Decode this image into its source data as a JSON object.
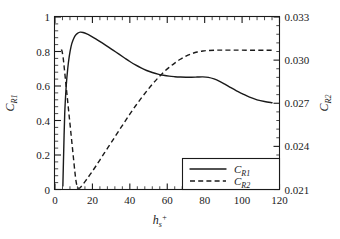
{
  "chart_data": {
    "type": "line",
    "title": "",
    "xlabel": "h_s^+",
    "xlabel_base": "h",
    "xlabel_sub": "s",
    "xlabel_sup": "+",
    "ylabel_left": "C_R1",
    "ylabel_left_base": "C",
    "ylabel_left_sub": "R1",
    "ylabel_right": "C_R2",
    "ylabel_right_base": "C",
    "ylabel_right_sub": "R2",
    "xlim": [
      0,
      120
    ],
    "ylim_left": [
      0,
      1
    ],
    "ylim_right": [
      0.021,
      0.033
    ],
    "xticks": [
      0,
      20,
      40,
      60,
      80,
      100,
      120
    ],
    "xtick_labels": [
      "0",
      "20",
      "40",
      "60",
      "80",
      "100",
      "120"
    ],
    "yticks_left": [
      0,
      0.2,
      0.4,
      0.6,
      0.8,
      1
    ],
    "ytick_labels_left": [
      "0",
      "0.2",
      "0.4",
      "0.6",
      "0.8",
      "1"
    ],
    "yticks_right": [
      0.021,
      0.024,
      0.027,
      0.03,
      0.033
    ],
    "ytick_labels_right": [
      "0.021",
      "0.024",
      "0.027",
      "0.030",
      "0.033"
    ],
    "grid": false,
    "minor_ticks_x": 4,
    "minor_ticks_y": 4,
    "legend_position": "bottom-right",
    "series": [
      {
        "name": "C_R1",
        "axis": "left",
        "style": "solid",
        "color": "#1a1a1a",
        "x": [
          4.2,
          4.6,
          5.2,
          6.0,
          6.8,
          7.6,
          8.6,
          9.6,
          10.8,
          12.0,
          13.5,
          15.0,
          17.0,
          19.0,
          22.0,
          25.0,
          28.0,
          31.0,
          34.0,
          37.0,
          40.0,
          43.0,
          46.0,
          49.0,
          52.0,
          55.0,
          58.0,
          61.0,
          64.0,
          67.0,
          70.0,
          73.0,
          76.0,
          79.0,
          82.0,
          85.0,
          88.0,
          91.0,
          94.0,
          97.0,
          100.0,
          104.0,
          108.0,
          112.0,
          116.0
        ],
        "y": [
          0.02,
          0.2,
          0.44,
          0.6,
          0.7,
          0.77,
          0.83,
          0.865,
          0.892,
          0.905,
          0.912,
          0.91,
          0.902,
          0.891,
          0.872,
          0.851,
          0.83,
          0.808,
          0.786,
          0.764,
          0.742,
          0.722,
          0.705,
          0.69,
          0.678,
          0.669,
          0.662,
          0.657,
          0.654,
          0.652,
          0.651,
          0.651,
          0.652,
          0.653,
          0.65,
          0.641,
          0.627,
          0.609,
          0.59,
          0.572,
          0.556,
          0.535,
          0.52,
          0.51,
          0.503
        ]
      },
      {
        "name": "C_R2",
        "axis": "right",
        "style": "dashed",
        "color": "#1a1a1a",
        "x": [
          3.4,
          3.8,
          4.4,
          5.0,
          5.8,
          6.6,
          7.4,
          8.2,
          9.0,
          9.8,
          10.6,
          11.2,
          11.8,
          12.6,
          13.6,
          15.0,
          17.0,
          19.5,
          22.0,
          25.0,
          28.0,
          31.0,
          34.0,
          37.0,
          40.0,
          43.0,
          46.0,
          49.0,
          52.0,
          55.0,
          58.0,
          61.0,
          64.0,
          67.0,
          70.0,
          73.0,
          76.0,
          79.0,
          82.0,
          86.0,
          90.0,
          95.0,
          100.0,
          106.0,
          112.0,
          116.0
        ],
        "y": [
          0.812,
          0.8,
          0.76,
          0.7,
          0.615,
          0.53,
          0.445,
          0.36,
          0.275,
          0.19,
          0.105,
          0.052,
          0.02,
          0.008,
          0.012,
          0.03,
          0.06,
          0.098,
          0.138,
          0.188,
          0.238,
          0.288,
          0.338,
          0.388,
          0.437,
          0.484,
          0.528,
          0.57,
          0.61,
          0.646,
          0.679,
          0.708,
          0.733,
          0.755,
          0.773,
          0.787,
          0.797,
          0.803,
          0.806,
          0.808,
          0.808,
          0.808,
          0.808,
          0.807,
          0.807,
          0.807
        ]
      }
    ]
  },
  "legend": {
    "entries": [
      {
        "label_base": "C",
        "label_sub": "R1",
        "style": "solid"
      },
      {
        "label_base": "C",
        "label_sub": "R2",
        "style": "dashed"
      }
    ]
  }
}
